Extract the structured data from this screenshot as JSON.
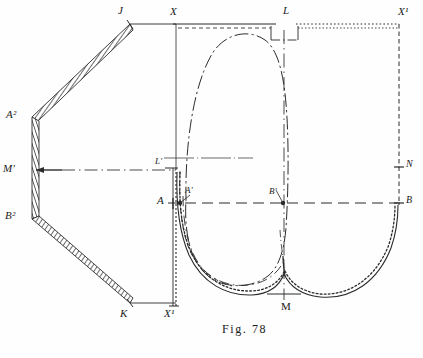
{
  "figure": {
    "caption": "Fig. 78",
    "title": "Fig. 78",
    "ink_color": "#2b2b2b",
    "paper_color": "#fefefe"
  },
  "labels": {
    "j": "J",
    "x_top_left": "X",
    "l": "L",
    "x1_top_right": "X¹",
    "a2": "A²",
    "m_prime": "M'",
    "b2": "B²",
    "l_prime": "L'",
    "n": "N",
    "a": "A",
    "a_prime": "A'",
    "b_prime": "B'",
    "b": "B",
    "k": "K",
    "x1_bottom": "X¹",
    "m": "M"
  },
  "label_positions": {
    "j": {
      "x": 118,
      "y": 6
    },
    "x_top_left": {
      "x": 172,
      "y": 8
    },
    "l": {
      "x": 285,
      "y": 6
    },
    "x1_top_right": {
      "x": 399,
      "y": 8
    },
    "a2": {
      "x": 8,
      "y": 108
    },
    "m_prime": {
      "x": 4,
      "y": 161
    },
    "b2": {
      "x": 6,
      "y": 208
    },
    "l_prime": {
      "x": 157,
      "y": 156
    },
    "n": {
      "x": 402,
      "y": 159
    },
    "a": {
      "x": 158,
      "y": 194
    },
    "a_prime": {
      "x": 183,
      "y": 186
    },
    "b_prime": {
      "x": 268,
      "y": 188
    },
    "b": {
      "x": 405,
      "y": 193
    },
    "k": {
      "x": 120,
      "y": 310
    },
    "x1_bottom": {
      "x": 166,
      "y": 311
    },
    "m": {
      "x": 283,
      "y": 303
    },
    "caption": {
      "x": 224,
      "y": 322
    }
  },
  "geometry": {
    "frame": {
      "x_left": 173,
      "x_right": 399,
      "y_top": 24,
      "y_bottom": 308,
      "axis_ab_y": 203,
      "axis_n_y": 167,
      "center_line_x": 284
    },
    "linkage": {
      "j": {
        "x": 130,
        "y": 24
      },
      "a2": {
        "x": 33,
        "y": 117
      },
      "b2": {
        "x": 33,
        "y": 219
      },
      "k": {
        "x": 130,
        "y": 303
      },
      "m_prime": {
        "x": 33,
        "y": 170
      }
    },
    "notch": {
      "left": 271,
      "right": 298,
      "top": 26,
      "bottom": 40
    }
  },
  "curves": {
    "outer_profile": {
      "style": "solid",
      "description": "cam heart profile lower outline"
    },
    "offset_profile": {
      "style": "dotted",
      "description": "dotted offset curve parallel to outer profile"
    },
    "pitch_curve": {
      "style": "dash-dot",
      "description": "long dash-dot closed loop through upper region"
    },
    "inner_dashed": {
      "style": "dashed",
      "description": "inner dashed arc near left edge"
    }
  },
  "line_styles": {
    "solid": "solid",
    "dashed": "dashed",
    "dotted": "dotted",
    "dash_dot": "dash-dot",
    "hatched": "hatched band"
  }
}
